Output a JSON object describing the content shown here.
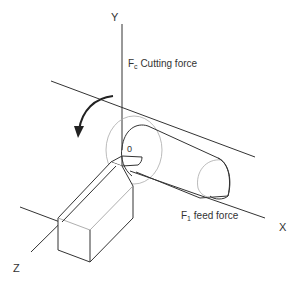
{
  "diagram": {
    "type": "lathe turning forces",
    "axes": {
      "x": "X",
      "y": "Y",
      "z": "Z",
      "origin": "0"
    },
    "labels": {
      "cutting_force_symbol": "F",
      "cutting_force_sub": "c",
      "cutting_force_text": " Cutting force",
      "feed_force_symbol": "F",
      "feed_force_sub": "1",
      "feed_force_text": " feed force"
    },
    "colors": {
      "line": "#333333",
      "light_line": "#999999",
      "background": "#ffffff"
    }
  }
}
